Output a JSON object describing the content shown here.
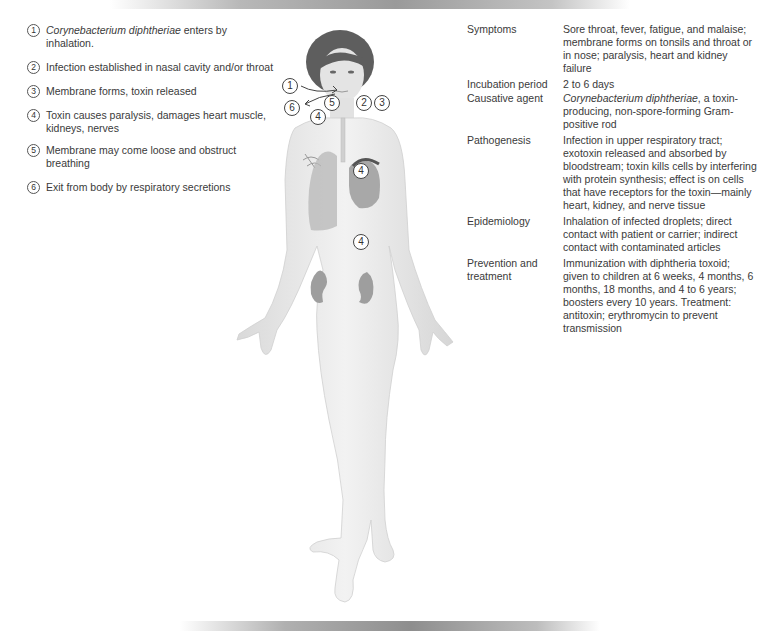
{
  "steps": [
    {
      "num": "1",
      "text_italic": "Corynebacterium diphtheriae",
      "text": " enters by inhalation."
    },
    {
      "num": "2",
      "text_italic": "",
      "text": "Infection established in nasal cavity and/or throat"
    },
    {
      "num": "3",
      "text_italic": "",
      "text": "Membrane forms, toxin released"
    },
    {
      "num": "4",
      "text_italic": "",
      "text": "Toxin causes paralysis, damages heart muscle, kidneys, nerves"
    },
    {
      "num": "5",
      "text_italic": "",
      "text": "Membrane may come loose and obstruct breathing"
    },
    {
      "num": "6",
      "text_italic": "",
      "text": "Exit from body by respiratory secretions"
    }
  ],
  "figure": {
    "markers": [
      {
        "num": "1",
        "label": "entry-by-inhalation"
      },
      {
        "num": "6",
        "label": "exit-respiratory"
      },
      {
        "num": "5",
        "label": "membrane-obstruction"
      },
      {
        "num": "2",
        "label": "nasal-throat-infection"
      },
      {
        "num": "3",
        "label": "membrane-toxin"
      },
      {
        "num": "4",
        "label": "lungs"
      },
      {
        "num": "4",
        "label": "heart"
      },
      {
        "num": "4",
        "label": "kidney"
      }
    ],
    "colors": {
      "skin": "#e9e9e9",
      "hair": "#5a5a5a",
      "organ": "#9a9a9a"
    }
  },
  "info": [
    {
      "label": "Symptoms",
      "value_italic": "",
      "value": "Sore throat, fever, fatigue, and malaise; membrane forms on tonsils and throat or in nose; paralysis, heart and kidney failure"
    },
    {
      "label": "Incubation period",
      "value_italic": "",
      "value": "2 to 6 days"
    },
    {
      "label": "Causative agent",
      "value_italic": "Corynebacterium diphtheriae",
      "value": ", a toxin-producing, non-spore-forming Gram-positive rod"
    },
    {
      "label": "Pathogenesis",
      "value_italic": "",
      "value": "Infection in upper respiratory tract; exotoxin released and absorbed by bloodstream; toxin kills cells by interfering with protein synthesis; effect is on cells that have receptors for the toxin—mainly heart, kidney, and nerve tissue"
    },
    {
      "label": "Epidemiology",
      "value_italic": "",
      "value": "Inhalation of infected droplets; direct contact with patient or carrier; indirect contact with contaminated articles"
    },
    {
      "label": "Prevention and treatment",
      "value_italic": "",
      "value": "Immunization with diphtheria toxoid; given to children at 6 weeks, 4 months, 6 months, 18 months, and 4 to 6 years; boosters every 10 years. Treatment: antitoxin; erythromycin to prevent transmission"
    }
  ]
}
